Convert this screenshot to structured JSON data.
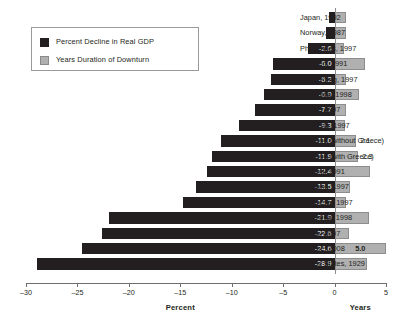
{
  "legend": {
    "items": [
      {
        "label": "Percent Decline in Real GDP",
        "swatch": "dark-square-icon",
        "color": "#231f20"
      },
      {
        "label": "Years Duration of Downturn",
        "swatch": "grey-square-icon",
        "color": "#b0b0b0"
      }
    ]
  },
  "axes": {
    "percent": {
      "title": "Percent",
      "ticks": [
        "-30",
        "-25",
        "-20",
        "-15",
        "-10",
        "-5",
        "0"
      ],
      "min": -30,
      "max": 0
    },
    "years": {
      "title": "Years",
      "ticks": [
        "0",
        "5"
      ],
      "min": 0,
      "max": 5
    }
  },
  "chart_data": {
    "type": "bar",
    "orientation": "horizontal",
    "title": "",
    "xlabel": "Percent",
    "ylabel": "",
    "secondary_xlabel": "Years",
    "xlim": [
      -30,
      5
    ],
    "grid": false,
    "legend_position": "top-left",
    "categories": [
      "Japan, 1992",
      "Norway, 1987",
      "Philippines, 1997",
      "Sweden, 1991",
      "Hong Kong, 1997",
      "Colombia, 1998",
      "Korea, 1997",
      "Malaysia, 1997",
      "Average (without Greece)",
      "Average (with Greece)",
      "Finland, 1991",
      "Thailand, 1997",
      "Indonesia, 1997",
      "Argentina, 1998",
      "Latvia, 2007",
      "Greece, 2008",
      "United States, 1929"
    ],
    "series": [
      {
        "name": "Percent Decline in Real GDP",
        "color": "#231f20",
        "values": [
          -0.5,
          -0.8,
          -2.6,
          -6.0,
          -6.2,
          -6.9,
          -7.7,
          -9.3,
          -11.0,
          -11.9,
          -12.4,
          -13.5,
          -14.7,
          -21.9,
          -22.6,
          -24.6,
          -28.9
        ],
        "labels": [
          "",
          "",
          "-2.6",
          "-6.0",
          "-6.2",
          "-6.9",
          "-7.7",
          "-9.3",
          "-11.0",
          "-11.9",
          "-12.4",
          "-13.5",
          "-14.7",
          "-21.9",
          "-22.6",
          "-24.6",
          "-28.9"
        ]
      },
      {
        "name": "Years Duration of Downturn",
        "color": "#b0b0b0",
        "values": [
          1.1,
          1.1,
          0.9,
          3.0,
          1.1,
          2.4,
          1.1,
          1.0,
          2.1,
          2.3,
          3.4,
          1.5,
          1.1,
          3.3,
          1.4,
          5.0,
          3.2
        ],
        "labels": [
          "",
          "",
          "",
          "",
          "",
          "",
          "",
          "",
          "2.1",
          "2.3",
          "",
          "",
          "",
          "",
          "",
          "5.0",
          ""
        ]
      }
    ]
  }
}
